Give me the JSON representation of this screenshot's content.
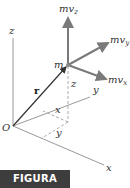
{
  "figure": {
    "caption": "FIGURA 3/15",
    "caption_bg": "#3d3d3d",
    "caption_color": "#ffffff"
  },
  "diagram": {
    "origin_label": "O",
    "axes": {
      "x": "x",
      "y": "y",
      "z": "z"
    },
    "point_label": "m",
    "position_vector_label": "r",
    "projection_labels": {
      "x": "x",
      "y": "y",
      "z": "z"
    },
    "momentum_components": [
      {
        "id": "mvz",
        "base": "mv",
        "sub": "z"
      },
      {
        "id": "mvy",
        "base": "mv",
        "sub": "y"
      },
      {
        "id": "mvx",
        "base": "mv",
        "sub": "x"
      }
    ],
    "colors": {
      "axis": "#9a9a9a",
      "vector_r": "#333333",
      "momentum": "#7a7a7a",
      "dashed": "#aaaaaa"
    }
  }
}
